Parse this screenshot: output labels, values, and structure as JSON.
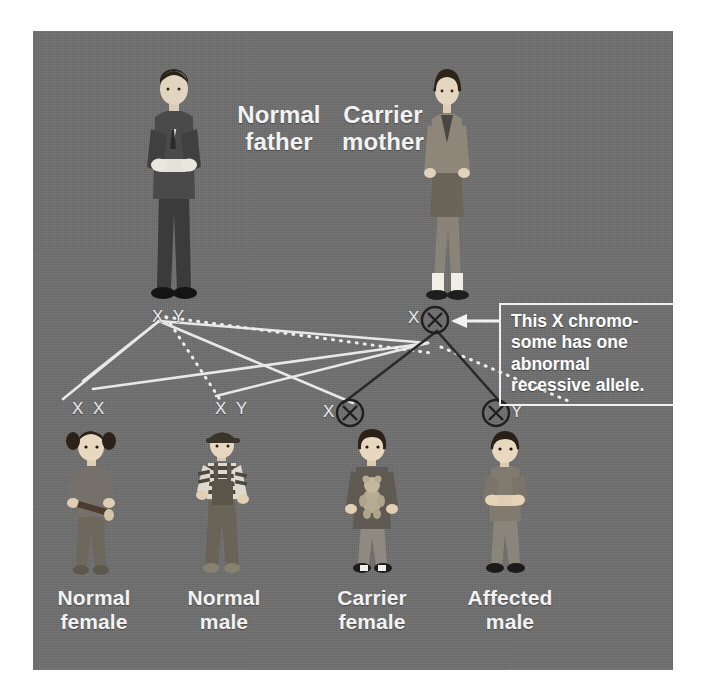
{
  "diagram": {
    "title_type": "x-linked-recessive-inheritance-pedigree",
    "background_color": "#6e6e6e",
    "text_color": "#f2f2f2",
    "parents": [
      {
        "label_line1": "Normal",
        "label_line2": "father",
        "genotype": "X Y",
        "sex": "male",
        "status": "normal"
      },
      {
        "label_line1": "Carrier",
        "label_line2": "mother",
        "genotype": "X",
        "genotype_extra": "circled-X",
        "sex": "female",
        "status": "carrier"
      }
    ],
    "children": [
      {
        "label_line1": "Normal",
        "label_line2": "female",
        "genotype": "X X",
        "sex": "female",
        "status": "normal"
      },
      {
        "label_line1": "Normal",
        "label_line2": "male",
        "genotype": "X Y",
        "sex": "male",
        "status": "normal"
      },
      {
        "label_line1": "Carrier",
        "label_line2": "female",
        "genotype": "X",
        "genotype_extra": "circled-X",
        "sex": "female",
        "status": "carrier"
      },
      {
        "label_line1": "Affected",
        "label_line2": "male",
        "genotype": "Y",
        "genotype_extra": "circled-X",
        "sex": "male",
        "status": "affected"
      }
    ],
    "callout": {
      "line1": "This X chromo-",
      "line2": "some has one",
      "line3": "abnormal",
      "line4": "recessive allele.",
      "border_color": "#f0f0f0",
      "arrow": "left-arrow-icon"
    },
    "legend_symbols": {
      "normal_allele": "X",
      "abnormal_allele": "circled-X",
      "male_allele": "Y"
    }
  }
}
